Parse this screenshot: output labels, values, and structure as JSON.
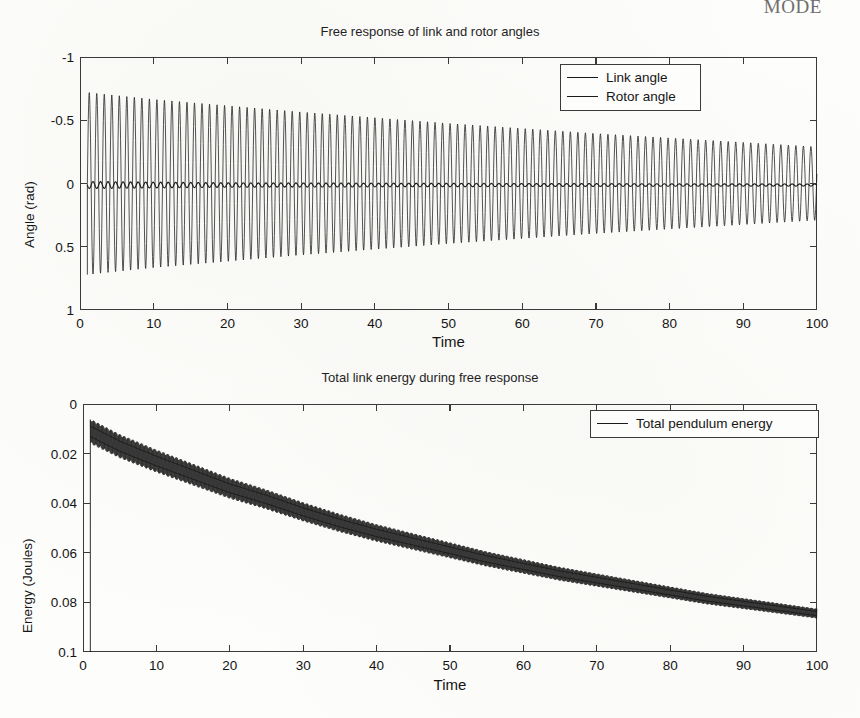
{
  "page": {
    "running_head": "MODE"
  },
  "figures": [
    {
      "id": "angles",
      "title": "Free response of link and rotor angles",
      "xlabel": "Time",
      "ylabel": "Angle (rad)",
      "xticks": [
        "0",
        "10",
        "20",
        "30",
        "40",
        "50",
        "60",
        "70",
        "80",
        "90",
        "100"
      ],
      "yticks": [
        "1",
        "0.5",
        "0",
        "-0.5",
        "-1"
      ],
      "legend": [
        {
          "label": "Link angle",
          "color": "#1a1a1a"
        },
        {
          "label": "Rotor angle",
          "color": "#1a1a1a"
        }
      ]
    },
    {
      "id": "energy",
      "title": "Total link energy during free response",
      "xlabel": "Time",
      "ylabel": "Energy (Joules)",
      "xticks": [
        "0",
        "10",
        "20",
        "30",
        "40",
        "50",
        "60",
        "70",
        "80",
        "90",
        "100"
      ],
      "yticks": [
        "0.1",
        "0.08",
        "0.06",
        "0.04",
        "0.02",
        "0"
      ],
      "legend": [
        {
          "label": "Total pendulum energy",
          "color": "#1a1a1a"
        }
      ]
    }
  ],
  "chart_data": [
    {
      "type": "line",
      "title": "Free response of link and rotor angles",
      "xlabel": "Time",
      "ylabel": "Angle (rad)",
      "xlim": [
        0,
        100
      ],
      "ylim": [
        -1,
        1
      ],
      "xticks": [
        0,
        10,
        20,
        30,
        40,
        50,
        60,
        70,
        80,
        90,
        100
      ],
      "yticks": [
        -1,
        -0.5,
        0,
        0.5,
        1
      ],
      "grid": false,
      "legend_position": "top-right",
      "series": [
        {
          "name": "Link angle",
          "description": "Lightly damped sinusoidal oscillation, period about 1.0 time units, starting at t=1 with amplitude 0.72 and decaying exponentially to amplitude 0.29 at t=100; mean value 0.",
          "start_time": 1.0,
          "period": 1.02,
          "amplitude_envelope": [
            {
              "t": 1,
              "a": 0.72
            },
            {
              "t": 10,
              "a": 0.665
            },
            {
              "t": 20,
              "a": 0.615
            },
            {
              "t": 30,
              "a": 0.565
            },
            {
              "t": 40,
              "a": 0.52
            },
            {
              "t": 50,
              "a": 0.475
            },
            {
              "t": 60,
              "a": 0.435
            },
            {
              "t": 70,
              "a": 0.395
            },
            {
              "t": 80,
              "a": 0.36
            },
            {
              "t": 90,
              "a": 0.325
            },
            {
              "t": 100,
              "a": 0.29
            }
          ],
          "color": "#1a1a1a"
        },
        {
          "name": "Rotor angle",
          "description": "Small amplitude ripple about zero, same frequency as link angle, amplitude near 0.035 early, decaying to about 0.015 at t=100.",
          "start_time": 1.0,
          "period": 1.02,
          "amplitude_envelope": [
            {
              "t": 1,
              "a": 0.05
            },
            {
              "t": 20,
              "a": 0.032
            },
            {
              "t": 50,
              "a": 0.024
            },
            {
              "t": 80,
              "a": 0.018
            },
            {
              "t": 100,
              "a": 0.015
            }
          ],
          "color": "#1a1a1a"
        }
      ]
    },
    {
      "type": "line",
      "title": "Total link energy during free response",
      "xlabel": "Time",
      "ylabel": "Energy (Joules)",
      "xlim": [
        0,
        100
      ],
      "ylim": [
        0,
        0.1
      ],
      "xticks": [
        0,
        10,
        20,
        30,
        40,
        50,
        60,
        70,
        80,
        90,
        100
      ],
      "yticks": [
        0,
        0.02,
        0.04,
        0.06,
        0.08,
        0.1
      ],
      "grid": false,
      "legend_position": "top-right",
      "series": [
        {
          "name": "Total pendulum energy",
          "description": "Energy jumps vertically from 0 to about 0.093 at t=1, then decays roughly exponentially with a fast high-frequency ripple band to about 0.015 at t=100.",
          "color": "#1a1a1a",
          "mean_curve": [
            {
              "t": 1,
              "e": 0.089
            },
            {
              "t": 5,
              "e": 0.083
            },
            {
              "t": 10,
              "e": 0.077
            },
            {
              "t": 15,
              "e": 0.0715
            },
            {
              "t": 20,
              "e": 0.066
            },
            {
              "t": 25,
              "e": 0.0615
            },
            {
              "t": 30,
              "e": 0.0565
            },
            {
              "t": 35,
              "e": 0.052
            },
            {
              "t": 40,
              "e": 0.048
            },
            {
              "t": 45,
              "e": 0.0445
            },
            {
              "t": 50,
              "e": 0.041
            },
            {
              "t": 55,
              "e": 0.0375
            },
            {
              "t": 60,
              "e": 0.0345
            },
            {
              "t": 65,
              "e": 0.0315
            },
            {
              "t": 70,
              "e": 0.029
            },
            {
              "t": 75,
              "e": 0.0265
            },
            {
              "t": 80,
              "e": 0.024
            },
            {
              "t": 85,
              "e": 0.0215
            },
            {
              "t": 90,
              "e": 0.0195
            },
            {
              "t": 95,
              "e": 0.0175
            },
            {
              "t": 100,
              "e": 0.0155
            }
          ],
          "ripple_band": [
            {
              "t": 1,
              "half_width": 0.005
            },
            {
              "t": 20,
              "half_width": 0.0042
            },
            {
              "t": 50,
              "half_width": 0.0032
            },
            {
              "t": 80,
              "half_width": 0.0024
            },
            {
              "t": 100,
              "half_width": 0.002
            }
          ]
        }
      ]
    }
  ]
}
